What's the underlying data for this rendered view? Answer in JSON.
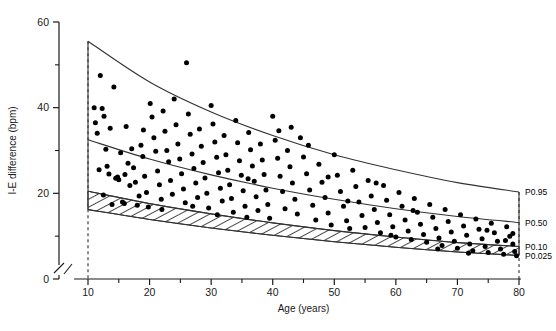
{
  "chart_data": {
    "type": "scatter",
    "title": "",
    "xlabel": "Age (years)",
    "ylabel": "I-E difference (bpm)",
    "xlim": [
      10,
      80
    ],
    "ylim": [
      0,
      60
    ],
    "xticks": [
      10,
      20,
      30,
      40,
      50,
      60,
      70,
      80
    ],
    "xminorticks": [
      15,
      25,
      35,
      45,
      55,
      65,
      75
    ],
    "yticks": [
      0,
      20,
      40,
      60
    ],
    "yminorticks": [
      10,
      30,
      50
    ],
    "grid": false,
    "legend": "none",
    "axis_break_x": true,
    "axis_break_y": true,
    "dashed_guide_x": [
      10,
      80
    ],
    "percentile_curves": [
      {
        "name": "P0.95",
        "label": "P0.95",
        "x": [
          10,
          20,
          30,
          40,
          50,
          60,
          70,
          80
        ],
        "y": [
          55.5,
          46.0,
          39.0,
          33.5,
          29.0,
          25.5,
          22.5,
          20.3
        ]
      },
      {
        "name": "P0.50",
        "label": "P0.50",
        "x": [
          10,
          20,
          30,
          40,
          50,
          60,
          70,
          80
        ],
        "y": [
          32.5,
          28.0,
          24.3,
          21.2,
          18.6,
          16.4,
          14.6,
          13.2
        ]
      },
      {
        "name": "P0.10",
        "label": "P0.10",
        "x": [
          10,
          20,
          30,
          40,
          50,
          60,
          70,
          80
        ],
        "y": [
          20.5,
          17.6,
          15.2,
          13.1,
          11.3,
          9.8,
          8.5,
          7.6
        ]
      },
      {
        "name": "P0.025",
        "label": "P0.025",
        "x": [
          10,
          20,
          30,
          40,
          50,
          60,
          70,
          80
        ],
        "y": [
          16.2,
          13.9,
          11.9,
          10.2,
          8.7,
          7.4,
          6.3,
          5.5
        ]
      }
    ],
    "hatched_band": {
      "between": [
        "P0.10",
        "P0.025"
      ],
      "pattern": "diagonal-hatch"
    },
    "points": [
      [
        11.0,
        40.0
      ],
      [
        11.2,
        36.5
      ],
      [
        11.5,
        34.0
      ],
      [
        11.8,
        25.5
      ],
      [
        12.0,
        47.5
      ],
      [
        12.3,
        39.8
      ],
      [
        12.6,
        38.0
      ],
      [
        12.9,
        30.3
      ],
      [
        13.1,
        26.3
      ],
      [
        13.4,
        24.5
      ],
      [
        13.6,
        35.2
      ],
      [
        13.9,
        17.4
      ],
      [
        14.2,
        44.8
      ],
      [
        14.5,
        23.5
      ],
      [
        14.8,
        23.8
      ],
      [
        15.0,
        23.2
      ],
      [
        15.3,
        29.5
      ],
      [
        15.6,
        18.0
      ],
      [
        15.9,
        17.6
      ],
      [
        16.2,
        35.6
      ],
      [
        16.5,
        27.0
      ],
      [
        16.8,
        21.8
      ],
      [
        17.1,
        30.4
      ],
      [
        17.4,
        26.0
      ],
      [
        17.7,
        22.6
      ],
      [
        18.0,
        17.2
      ],
      [
        18.3,
        19.4
      ],
      [
        18.6,
        31.2
      ],
      [
        18.9,
        28.6
      ],
      [
        19.2,
        24.0
      ],
      [
        19.5,
        20.2
      ],
      [
        19.8,
        16.8
      ],
      [
        20.1,
        41.0
      ],
      [
        20.4,
        37.8
      ],
      [
        20.7,
        33.0
      ],
      [
        21.0,
        29.8
      ],
      [
        21.3,
        25.2
      ],
      [
        21.6,
        22.0
      ],
      [
        21.9,
        18.6
      ],
      [
        22.2,
        39.2
      ],
      [
        22.5,
        34.5
      ],
      [
        22.8,
        30.0
      ],
      [
        23.1,
        27.4
      ],
      [
        23.4,
        23.0
      ],
      [
        23.7,
        19.8
      ],
      [
        24.0,
        42.0
      ],
      [
        24.3,
        36.0
      ],
      [
        24.6,
        31.5
      ],
      [
        24.9,
        28.0
      ],
      [
        25.2,
        24.6
      ],
      [
        25.5,
        21.0
      ],
      [
        25.8,
        17.8
      ],
      [
        26.0,
        50.5
      ],
      [
        26.3,
        38.5
      ],
      [
        26.6,
        33.8
      ],
      [
        26.9,
        29.2
      ],
      [
        27.2,
        25.8
      ],
      [
        27.5,
        22.4
      ],
      [
        27.8,
        19.0
      ],
      [
        28.1,
        35.0
      ],
      [
        28.4,
        31.0
      ],
      [
        28.7,
        27.2
      ],
      [
        29.0,
        23.6
      ],
      [
        29.3,
        20.0
      ],
      [
        29.6,
        16.6
      ],
      [
        30.0,
        40.5
      ],
      [
        30.3,
        36.2
      ],
      [
        30.6,
        32.0
      ],
      [
        30.9,
        28.4
      ],
      [
        31.2,
        24.8
      ],
      [
        31.5,
        21.2
      ],
      [
        31.8,
        18.2
      ],
      [
        32.1,
        33.5
      ],
      [
        32.4,
        29.0
      ],
      [
        32.7,
        25.4
      ],
      [
        33.0,
        22.0
      ],
      [
        33.3,
        18.8
      ],
      [
        33.6,
        15.6
      ],
      [
        34.0,
        37.0
      ],
      [
        34.3,
        31.8
      ],
      [
        34.6,
        27.6
      ],
      [
        34.9,
        24.2
      ],
      [
        35.2,
        20.6
      ],
      [
        35.5,
        17.0
      ],
      [
        35.8,
        14.4
      ],
      [
        36.1,
        34.2
      ],
      [
        36.4,
        30.2
      ],
      [
        36.7,
        26.4
      ],
      [
        37.0,
        22.8
      ],
      [
        37.3,
        19.2
      ],
      [
        37.6,
        16.0
      ],
      [
        38.0,
        31.5
      ],
      [
        38.3,
        27.8
      ],
      [
        38.6,
        24.4
      ],
      [
        38.9,
        20.8
      ],
      [
        39.2,
        17.4
      ],
      [
        39.5,
        14.2
      ],
      [
        40.0,
        38.0
      ],
      [
        40.4,
        32.4
      ],
      [
        40.8,
        28.2
      ],
      [
        41.2,
        24.0
      ],
      [
        41.6,
        20.4
      ],
      [
        42.0,
        16.4
      ],
      [
        42.4,
        30.0
      ],
      [
        42.8,
        26.2
      ],
      [
        43.2,
        22.4
      ],
      [
        43.6,
        18.6
      ],
      [
        44.0,
        15.2
      ],
      [
        44.5,
        33.0
      ],
      [
        45.0,
        28.5
      ],
      [
        45.5,
        24.6
      ],
      [
        46.0,
        20.8
      ],
      [
        46.5,
        17.2
      ],
      [
        47.0,
        13.8
      ],
      [
        47.5,
        26.8
      ],
      [
        48.0,
        22.6
      ],
      [
        48.5,
        19.0
      ],
      [
        49.0,
        15.4
      ],
      [
        49.5,
        12.6
      ],
      [
        50.0,
        29.0
      ],
      [
        50.5,
        24.2
      ],
      [
        51.0,
        20.4
      ],
      [
        51.5,
        17.0
      ],
      [
        52.0,
        13.6
      ],
      [
        52.5,
        11.8
      ],
      [
        53.0,
        25.4
      ],
      [
        53.5,
        21.6
      ],
      [
        54.0,
        18.0
      ],
      [
        54.5,
        14.8
      ],
      [
        55.0,
        12.0
      ],
      [
        55.5,
        23.0
      ],
      [
        56.0,
        19.4
      ],
      [
        56.5,
        16.2
      ],
      [
        57.0,
        13.2
      ],
      [
        57.5,
        10.8
      ],
      [
        58.0,
        21.8
      ],
      [
        58.5,
        18.4
      ],
      [
        59.0,
        15.0
      ],
      [
        59.5,
        12.2
      ],
      [
        60.0,
        9.8
      ],
      [
        60.5,
        20.2
      ],
      [
        61.0,
        17.0
      ],
      [
        61.5,
        13.8
      ],
      [
        62.0,
        11.2
      ],
      [
        62.5,
        9.2
      ],
      [
        63.0,
        18.8
      ],
      [
        63.5,
        15.6
      ],
      [
        64.0,
        12.8
      ],
      [
        64.5,
        10.4
      ],
      [
        65.0,
        8.6
      ],
      [
        65.5,
        17.4
      ],
      [
        66.0,
        14.4
      ],
      [
        66.5,
        11.8
      ],
      [
        67.0,
        9.6
      ],
      [
        67.5,
        7.8
      ],
      [
        68.0,
        16.2
      ],
      [
        68.5,
        13.4
      ],
      [
        69.0,
        11.0
      ],
      [
        69.5,
        8.8
      ],
      [
        70.0,
        7.2
      ],
      [
        70.5,
        15.0
      ],
      [
        71.0,
        12.4
      ],
      [
        71.5,
        10.2
      ],
      [
        72.0,
        8.2
      ],
      [
        72.5,
        6.6
      ],
      [
        73.0,
        14.0
      ],
      [
        73.5,
        11.6
      ],
      [
        74.0,
        9.4
      ],
      [
        74.5,
        7.6
      ],
      [
        75.0,
        6.2
      ],
      [
        75.5,
        13.0
      ],
      [
        76.0,
        10.8
      ],
      [
        76.5,
        8.8
      ],
      [
        77.0,
        7.0
      ],
      [
        77.5,
        5.8
      ],
      [
        78.0,
        12.2
      ],
      [
        78.5,
        10.0
      ],
      [
        79.0,
        8.2
      ],
      [
        79.3,
        6.4
      ],
      [
        79.6,
        5.4
      ],
      [
        12.5,
        19.6
      ],
      [
        16.0,
        24.4
      ],
      [
        19.0,
        34.8
      ],
      [
        22.0,
        16.2
      ],
      [
        27.0,
        17.0
      ],
      [
        31.0,
        15.0
      ],
      [
        36.0,
        23.4
      ],
      [
        41.0,
        34.6
      ],
      [
        43.0,
        35.4
      ],
      [
        45.8,
        31.2
      ],
      [
        49.0,
        23.8
      ],
      [
        52.2,
        18.2
      ],
      [
        56.8,
        22.4
      ],
      [
        59.2,
        10.2
      ],
      [
        62.8,
        16.0
      ],
      [
        66.8,
        7.0
      ],
      [
        71.8,
        6.0
      ],
      [
        74.8,
        11.4
      ],
      [
        77.8,
        9.0
      ],
      [
        79.0,
        10.6
      ]
    ]
  },
  "labels": {
    "xlabel": "Age (years)",
    "ylabel": "I-E difference (bpm)",
    "xticks": [
      "10",
      "20",
      "30",
      "40",
      "50",
      "60",
      "70",
      "80"
    ],
    "yticks": [
      "0",
      "20",
      "40",
      "60"
    ],
    "percentiles": [
      "P0.95",
      "P0.50",
      "P0.10",
      "P0.025"
    ]
  },
  "caption": {
    "text": ""
  },
  "colors": {
    "ink": "#1a1a1a",
    "point": "#000000",
    "curve": "#333333",
    "background": "#ffffff"
  }
}
